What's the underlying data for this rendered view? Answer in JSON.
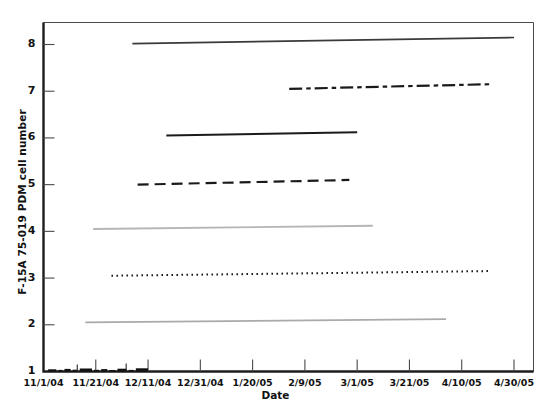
{
  "chart_data": {
    "type": "line",
    "title": "",
    "xlabel": "Date",
    "ylabel": "F-15A 75-019 PDM cell number",
    "grid": false,
    "legend": "none",
    "xlim": [
      "11/1/04",
      "5/10/05"
    ],
    "ylim": [
      1,
      8.4
    ],
    "x_tick_labels": [
      "11/1/04",
      "11/21/04",
      "12/11/04",
      "12/31/04",
      "1/20/05",
      "2/9/05",
      "3/1/05",
      "3/21/05",
      "4/10/05",
      "4/30/05"
    ],
    "y_tick_labels": [
      "1",
      "2",
      "3",
      "4",
      "5",
      "6",
      "7",
      "8"
    ],
    "y_tick_values": [
      1,
      2,
      3,
      4,
      5,
      6,
      7,
      8
    ],
    "series": [
      {
        "name": "cell-8",
        "style": "solid",
        "color": "#3a3a3a",
        "width": 1.7,
        "x_start": "12/5/04",
        "x_end": "4/30/05",
        "y_start": 8.02,
        "y_end": 8.15
      },
      {
        "name": "cell-7",
        "style": "dash-dot",
        "color": "#1a1a1a",
        "width": 2.2,
        "x_start": "2/3/05",
        "x_end": "4/21/05",
        "y_start": 7.05,
        "y_end": 7.15
      },
      {
        "name": "cell-6",
        "style": "solid",
        "color": "#1a1a1a",
        "width": 2.0,
        "x_start": "12/18/04",
        "x_end": "3/1/05",
        "y_start": 6.05,
        "y_end": 6.12
      },
      {
        "name": "cell-5",
        "style": "dashed",
        "color": "#1a1a1a",
        "width": 2.2,
        "x_start": "12/7/04",
        "x_end": "2/26/05",
        "y_start": 5.0,
        "y_end": 5.1
      },
      {
        "name": "cell-4",
        "style": "solid",
        "color": "#b5b5b5",
        "width": 1.8,
        "x_start": "11/20/04",
        "x_end": "3/7/05",
        "y_start": 4.05,
        "y_end": 4.12
      },
      {
        "name": "cell-3",
        "style": "dotted",
        "color": "#1a1a1a",
        "width": 2.0,
        "x_start": "11/27/04",
        "x_end": "4/21/05",
        "y_start": 3.05,
        "y_end": 3.15
      },
      {
        "name": "cell-2",
        "style": "solid",
        "color": "#aaaaaa",
        "width": 1.8,
        "x_start": "11/17/04",
        "x_end": "4/4/05",
        "y_start": 2.05,
        "y_end": 2.12
      },
      {
        "name": "cell-1-baseline",
        "style": "solid-cluster",
        "color": "#111111",
        "width": 3.0,
        "x_start": "11/2/04",
        "x_end": "12/11/04",
        "y_start": 1.0,
        "y_end": 1.0
      }
    ]
  }
}
